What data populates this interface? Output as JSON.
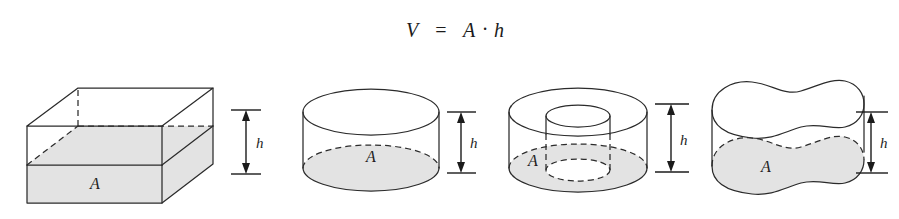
{
  "figure": {
    "caption_formula": {
      "volume_symbol": "V",
      "equals": "=",
      "area_symbol": "A",
      "dot_operator": "·",
      "height_symbol": "h",
      "full_text": "V = A · h"
    },
    "background_color": "#ffffff",
    "line_color": "#2b2b2b",
    "shade_color": "#e3e3e3",
    "text_color": "#1d1d1d",
    "shapes": [
      {
        "name": "rectangular-prism",
        "base_label": "A",
        "height_label": "h",
        "base_shaded": true,
        "hidden_edges_dashed": true
      },
      {
        "name": "cylinder",
        "base_label": "A",
        "height_label": "h",
        "base_shaded": true,
        "hidden_edges_dashed": true
      },
      {
        "name": "hollow-cylinder",
        "base_label": "A",
        "height_label": "h",
        "base_shaded": true,
        "hidden_edges_dashed": true
      },
      {
        "name": "irregular-prism",
        "base_label": "A",
        "height_label": "h",
        "base_shaded": true,
        "hidden_edges_dashed": true
      }
    ]
  }
}
